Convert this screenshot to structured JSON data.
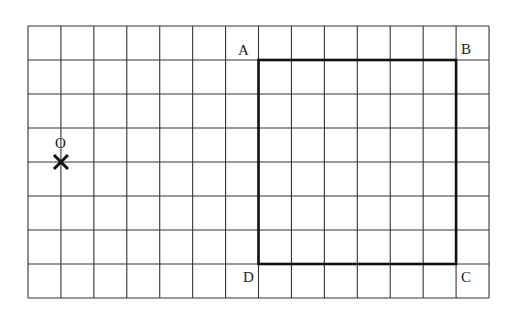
{
  "grid": {
    "columns": 14,
    "rows": 8,
    "left": 28,
    "top": 26,
    "cell_w": 32.93,
    "cell_h": 34,
    "line_color": "#333333"
  },
  "rectangle": {
    "corners": {
      "A": [
        7,
        1
      ],
      "B": [
        13,
        1
      ],
      "C": [
        13,
        7
      ],
      "D": [
        7,
        7
      ]
    },
    "stroke_color": "#111111"
  },
  "point_O": {
    "label": "O",
    "marker": "×",
    "grid_pos": [
      1,
      4
    ]
  },
  "labels": {
    "A": "A",
    "B": "B",
    "C": "C",
    "D": "D",
    "O": "O"
  }
}
